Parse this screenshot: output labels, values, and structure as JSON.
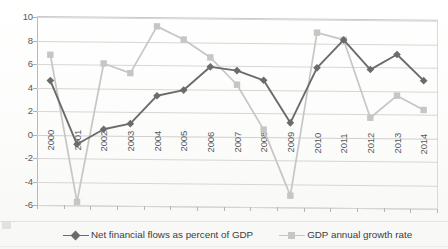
{
  "chart_data": {
    "type": "line",
    "title": "",
    "xlabel": "",
    "ylabel": "",
    "ylim": [
      -6,
      10
    ],
    "ytick_values": [
      10,
      8,
      6,
      4,
      2,
      0,
      -2,
      -4,
      -6
    ],
    "ytick_labels": [
      "10",
      "8",
      "6",
      "4",
      "2",
      "0",
      "-2",
      "-4",
      "-6"
    ],
    "grid": true,
    "legend_position": "bottom",
    "categories": [
      "2000",
      "2001",
      "2002",
      "2003",
      "2004",
      "2005",
      "2006",
      "2007",
      "2008",
      "2009",
      "2010",
      "2011",
      "2012",
      "2013",
      "2014"
    ],
    "series": [
      {
        "name": "Net financial flows as percent of GDP",
        "color": "#6b6b6b",
        "marker": "diamond",
        "values": [
          4.6,
          -0.8,
          0.5,
          1.0,
          3.4,
          3.9,
          5.9,
          5.6,
          4.8,
          1.2,
          5.9,
          8.3,
          5.8,
          7.1,
          4.9
        ]
      },
      {
        "name": "GDP annual growth rate",
        "color": "#c6c6c6",
        "marker": "square",
        "values": [
          6.8,
          -5.7,
          6.1,
          5.3,
          9.3,
          8.2,
          6.7,
          4.4,
          0.6,
          -5.0,
          8.9,
          8.3,
          1.7,
          3.6,
          2.4
        ]
      }
    ]
  },
  "legend": {
    "entries": [
      {
        "label": "Net financial flows as percent of GDP",
        "icon": "diamond-marker-icon"
      },
      {
        "label": "GDP annual growth rate",
        "icon": "square-marker-icon"
      }
    ]
  },
  "colors": {
    "series_dark": "#6b6b6b",
    "series_light": "#c6c6c6",
    "gridline": "#d6d6d6",
    "axis_text": "#58585a",
    "background": "#ffffff"
  }
}
